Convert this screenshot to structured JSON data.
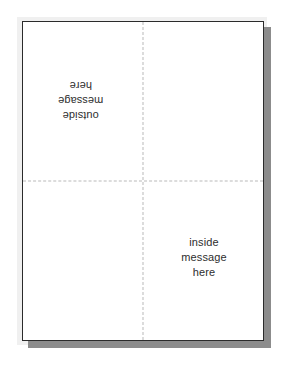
{
  "canvas": {
    "width": 287,
    "height": 373,
    "background_color": "#ffffff"
  },
  "sheet": {
    "name": "folded-card-sheet",
    "background_color": "#ffffff",
    "border_color": "#2b2b2b",
    "shadow_color": "#8c8c8c",
    "soft_shadow_color": "#f0f0f0"
  },
  "fold_lines": {
    "style": "dashed",
    "color": "#b9b9b9",
    "vertical_label": "vertical-fold",
    "horizontal_label": "horizontal-fold"
  },
  "quadrants": [
    {
      "position": "top-left",
      "name": "outside-message-panel",
      "text": "outside\nmessage\nhere",
      "rotation": 180,
      "has_text": true
    },
    {
      "position": "top-right",
      "name": "blank-panel-top-right",
      "text": "",
      "rotation": 0,
      "has_text": false
    },
    {
      "position": "bottom-left",
      "name": "blank-panel-bottom-left",
      "text": "",
      "rotation": 0,
      "has_text": false
    },
    {
      "position": "bottom-right",
      "name": "inside-message-panel",
      "text": "inside\nmessage\nhere",
      "rotation": 0,
      "has_text": true
    }
  ]
}
